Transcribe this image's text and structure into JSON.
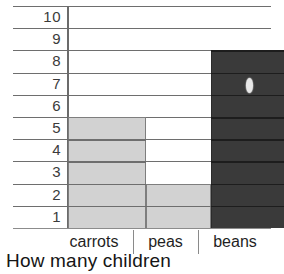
{
  "chart_data": {
    "type": "bar",
    "title": "",
    "caption": "How many children",
    "xlabel": "",
    "ylabel": "",
    "categories": [
      "carrots",
      "peas",
      "beans"
    ],
    "values": [
      5,
      2,
      8
    ],
    "ylim": [
      0,
      10
    ],
    "y_ticks": [
      "1",
      "2",
      "3",
      "4",
      "5",
      "6",
      "7",
      "8",
      "9",
      "10"
    ],
    "grid": true,
    "legend": "none",
    "series": [
      {
        "name": "children",
        "values": [
          5,
          2,
          8
        ]
      }
    ],
    "bar_colors": [
      "#d2d2d2",
      "#d2d2d2",
      "#3a3a3a"
    ],
    "annotations": [
      {
        "name": "scan-artifact",
        "text": "0",
        "on_category": "beans",
        "near_value": 7
      }
    ]
  },
  "colors": {
    "bar_light": "#d2d2d2",
    "bar_dark": "#3a3a3a",
    "gridline": "#6e6e6e",
    "axis": "#6b6b6b",
    "text": "#1f1f1f",
    "background": "#ffffff"
  }
}
